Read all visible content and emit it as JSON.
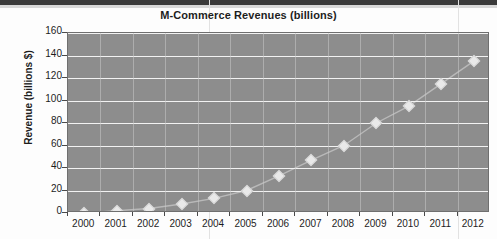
{
  "chart_data": {
    "type": "line",
    "title": "M-Commerce Revenues (billions)",
    "xlabel": "",
    "ylabel": "Revenue (billions $)",
    "categories": [
      "2000",
      "2001",
      "2002",
      "2003",
      "2004",
      "2005",
      "2006",
      "2007",
      "2008",
      "2009",
      "2010",
      "2011",
      "2012"
    ],
    "values": [
      0,
      2,
      4,
      8,
      13,
      20,
      33,
      47,
      60,
      80,
      95,
      115,
      135
    ],
    "series": [
      {
        "name": "M-Commerce Revenues",
        "values": [
          0,
          2,
          4,
          8,
          13,
          20,
          33,
          47,
          60,
          80,
          95,
          115,
          135
        ]
      }
    ],
    "ylim": [
      0,
      160
    ],
    "yticks": [
      0,
      20,
      40,
      60,
      80,
      100,
      120,
      140,
      160
    ],
    "ytick_labels": [
      "0",
      "20",
      "40",
      "60",
      "80",
      "100",
      "120",
      "140",
      "160"
    ],
    "grid": true,
    "legend": "none",
    "marker": "diamond",
    "colors": {
      "plot_background": "#8d8d8d",
      "gridline": "#f2f2f2",
      "marker_fill": "#e9e9e9",
      "line": "#b9b9b9",
      "text": "#1d1d1d",
      "plot_border": "#6f6f6f"
    }
  }
}
